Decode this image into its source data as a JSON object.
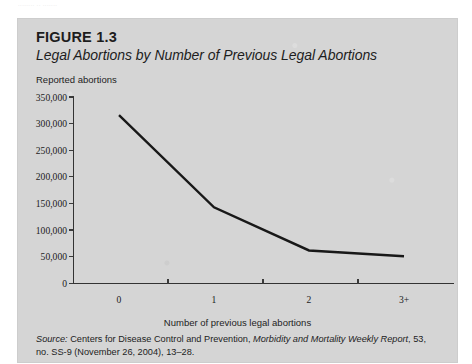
{
  "page": {
    "top_artifact_text": "........ .. ......."
  },
  "figure": {
    "number": "FIGURE 1.3",
    "title": "Legal Abortions by Number of Previous Legal Abortions",
    "y_axis_caption": "Reported abortions",
    "x_axis_caption": "Number of previous legal abortions"
  },
  "source": {
    "label": "Source:",
    "text_1": " Centers for Disease Control and Prevention, ",
    "publication": "Morbidity and Mortality Weekly Report",
    "text_2": ", 53, no. SS-9 (November 26, 2004), 13–28."
  },
  "colors": {
    "panel_background": "#d5d5d5",
    "page_background": "#ffffff",
    "line": "#181818",
    "axis": "#333333",
    "text": "#1d1d1d"
  },
  "chart_data": {
    "type": "line",
    "title": "Legal Abortions by Number of Previous Legal Abortions",
    "xlabel": "Number of previous legal abortions",
    "ylabel": "Reported abortions",
    "categories": [
      "0",
      "1",
      "2",
      "3+"
    ],
    "values": [
      316000,
      143000,
      62000,
      51000
    ],
    "ylim": [
      0,
      350000
    ],
    "ytick_values": [
      0,
      50000,
      100000,
      150000,
      200000,
      250000,
      300000,
      350000
    ],
    "ytick_labels": [
      "0",
      "50,000",
      "100,000",
      "150,000",
      "200,000",
      "250,000",
      "300,000",
      "350,000"
    ],
    "xtick_labels": [
      "0",
      "1",
      "2",
      "3+"
    ],
    "grid": false,
    "legend": false
  }
}
